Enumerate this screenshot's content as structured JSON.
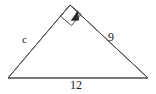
{
  "figure": {
    "type": "geometry-diagram",
    "shape": "right-triangle",
    "background_color": "#ffffff",
    "stroke_color": "#4a4a4a",
    "label_color": "#1a1a1a",
    "width": 156,
    "height": 94,
    "vertices": {
      "left": [
        8,
        78
      ],
      "apex": [
        70,
        5
      ],
      "right": [
        148,
        78
      ]
    },
    "right_angle": {
      "at_vertex": "apex",
      "marker": "square",
      "pointer": "arrowhead",
      "marker_size": 13
    },
    "sides": [
      {
        "name": "left-side",
        "from": "left",
        "to": "apex",
        "label": "c"
      },
      {
        "name": "right-side",
        "from": "apex",
        "to": "right",
        "label": "9"
      },
      {
        "name": "base-side",
        "from": "left",
        "to": "right",
        "label": "12"
      }
    ],
    "labels": {
      "hypotenuse_left": "c",
      "leg_right": "9",
      "base": "12"
    }
  }
}
